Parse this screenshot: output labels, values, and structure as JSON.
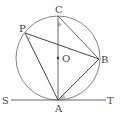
{
  "diagram": {
    "type": "geometry",
    "points": {
      "C": {
        "label": "C",
        "x": 58,
        "y": 16
      },
      "P": {
        "label": "P",
        "x": 25,
        "y": 33
      },
      "O": {
        "label": "O",
        "x": 58,
        "y": 58
      },
      "B": {
        "label": "B",
        "x": 99,
        "y": 59
      },
      "A": {
        "label": "A",
        "x": 58,
        "y": 100
      },
      "S": {
        "label": "S",
        "x": 6,
        "y": 100
      },
      "T": {
        "label": "T",
        "x": 110,
        "y": 100
      }
    },
    "circle": {
      "center": "O",
      "radius": 42
    },
    "segments": [
      "CA",
      "PB",
      "PA",
      "AB",
      "CB",
      "ST"
    ],
    "marked_angles": [
      "ACB",
      "APB",
      "BAT"
    ],
    "colors": {
      "line": "#555555",
      "angle_fill": "#bbbbbb"
    }
  }
}
